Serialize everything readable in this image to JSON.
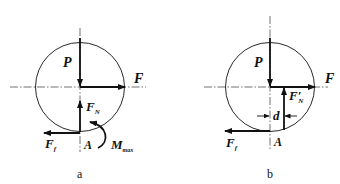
{
  "figures": [
    {
      "id": "a",
      "caption": "a",
      "labels": {
        "P": "P",
        "F": "F",
        "FN_main": "F",
        "FN_sub": "N",
        "Ff_main": "F",
        "Ff_sub": "f",
        "A": "A",
        "M_main": "M",
        "M_sub": "max"
      }
    },
    {
      "id": "b",
      "caption": "b",
      "labels": {
        "P": "P",
        "F": "F",
        "FN_main": "F′",
        "FN_sub": "N",
        "Ff_main": "F",
        "Ff_sub": "f",
        "A": "A",
        "d": "d"
      }
    }
  ],
  "colors": {
    "line": "#111111",
    "background": "#ffffff"
  }
}
